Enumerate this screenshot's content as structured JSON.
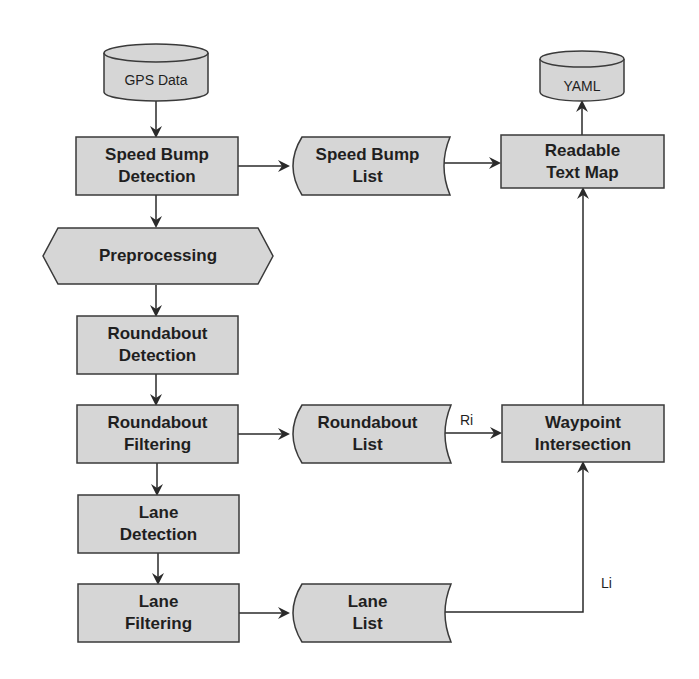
{
  "diagram": {
    "type": "flowchart",
    "colors": {
      "fill": "#d6d6d6",
      "stroke": "#3a3a3a",
      "text": "#1f1f1f",
      "background": "#ffffff"
    },
    "nodes": {
      "gps_data": {
        "label": "GPS Data",
        "shape": "cylinder"
      },
      "speed_bump_detection": {
        "label": "Speed Bump Detection",
        "line1": "Speed Bump",
        "line2": "Detection",
        "shape": "process"
      },
      "speed_bump_list": {
        "label": "Speed Bump List",
        "line1": "Speed Bump",
        "line2": "List",
        "shape": "stored-data"
      },
      "readable_text_map": {
        "label": "Readable Text Map",
        "line1": "Readable",
        "line2": "Text Map",
        "shape": "process"
      },
      "yaml": {
        "label": "YAML",
        "shape": "cylinder"
      },
      "preprocessing": {
        "label": "Preprocessing",
        "shape": "hexagon"
      },
      "roundabout_detection": {
        "label": "Roundabout Detection",
        "line1": "Roundabout",
        "line2": "Detection",
        "shape": "process"
      },
      "roundabout_filtering": {
        "label": "Roundabout Filtering",
        "line1": "Roundabout",
        "line2": "Filtering",
        "shape": "process"
      },
      "roundabout_list": {
        "label": "Roundabout List",
        "line1": "Roundabout",
        "line2": "List",
        "shape": "stored-data"
      },
      "waypoint_intersection": {
        "label": "Waypoint Intersection",
        "line1": "Waypoint",
        "line2": "Intersection",
        "shape": "process"
      },
      "lane_detection": {
        "label": "Lane Detection",
        "line1": "Lane",
        "line2": "Detection",
        "shape": "process"
      },
      "lane_filtering": {
        "label": "Lane Filtering",
        "line1": "Lane",
        "line2": "Filtering",
        "shape": "process"
      },
      "lane_list": {
        "label": "Lane List",
        "line1": "Lane",
        "line2": "List",
        "shape": "stored-data"
      }
    },
    "edges": [
      {
        "from": "GPS Data",
        "to": "Speed Bump Detection",
        "label": ""
      },
      {
        "from": "Speed Bump Detection",
        "to": "Speed Bump List",
        "label": ""
      },
      {
        "from": "Speed Bump List",
        "to": "Readable Text Map",
        "label": ""
      },
      {
        "from": "Readable Text Map",
        "to": "YAML",
        "label": ""
      },
      {
        "from": "Speed Bump Detection",
        "to": "Preprocessing",
        "label": ""
      },
      {
        "from": "Preprocessing",
        "to": "Roundabout Detection",
        "label": ""
      },
      {
        "from": "Roundabout Detection",
        "to": "Roundabout Filtering",
        "label": ""
      },
      {
        "from": "Roundabout Filtering",
        "to": "Roundabout List",
        "label": ""
      },
      {
        "from": "Roundabout List",
        "to": "Waypoint Intersection",
        "label": "Ri"
      },
      {
        "from": "Roundabout Filtering",
        "to": "Lane Detection",
        "label": ""
      },
      {
        "from": "Lane Detection",
        "to": "Lane Filtering",
        "label": ""
      },
      {
        "from": "Lane Filtering",
        "to": "Lane List",
        "label": ""
      },
      {
        "from": "Lane List",
        "to": "Waypoint Intersection",
        "label": "Li"
      },
      {
        "from": "Waypoint Intersection",
        "to": "Readable Text Map",
        "label": ""
      }
    ],
    "edge_labels": {
      "ri": "Ri",
      "li": "Li"
    }
  }
}
